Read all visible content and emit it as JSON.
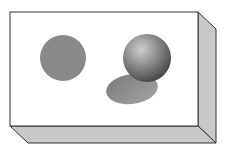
{
  "diagram": {
    "colors": {
      "background": "#ffffff",
      "front_face": "#ffffff",
      "side_face": "#c8c8c8",
      "edge": "#333333",
      "disc": "#8a8a8a",
      "sphere_light": "#c9c9c9",
      "sphere_dark": "#4a4a4a",
      "shadow": "#8c8c8c"
    },
    "elements": {
      "box": {
        "front": [
          10,
          12,
          198,
          126
        ],
        "depth": 18
      },
      "disc": {
        "cx": 63,
        "cy": 58,
        "r": 23
      },
      "sphere": {
        "cx": 147,
        "cy": 58,
        "r": 24
      },
      "shadow": {
        "cx": 132,
        "cy": 89,
        "rx": 26,
        "ry": 15,
        "rotate": -8
      }
    }
  }
}
